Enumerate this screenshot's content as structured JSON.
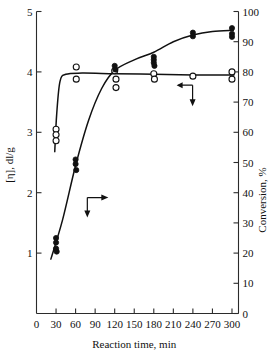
{
  "chart_data": {
    "type": "scatter",
    "title": "",
    "xlabel": "Reaction time, min",
    "ylabel": "[η], dl/g",
    "y2label": "Conversion, %",
    "xlim": [
      0,
      310
    ],
    "ylim": [
      0,
      5
    ],
    "y2lim": [
      0,
      100
    ],
    "xticks": [
      0,
      30,
      60,
      90,
      120,
      150,
      180,
      210,
      240,
      270,
      300
    ],
    "xticklabels": [
      "0",
      "30",
      "60",
      "90",
      "120",
      "150",
      "180",
      "210",
      "240",
      "270",
      "300"
    ],
    "yticks": [
      1,
      2,
      3,
      4,
      5
    ],
    "yticklabels": [
      "1",
      "2",
      "3",
      "4",
      "5"
    ],
    "y2ticks": [
      0,
      10,
      20,
      30,
      40,
      50,
      60,
      70,
      80,
      90,
      100
    ],
    "y2ticklabels": [
      "0",
      "10",
      "20",
      "30",
      "40",
      "50",
      "60",
      "70",
      "80",
      "90",
      "100"
    ],
    "grid": false,
    "legend": "none",
    "series": [
      {
        "name": "[η], dl/g",
        "marker": "open-circle",
        "axis": "left",
        "points": [
          {
            "x": 30,
            "y": 3.05
          },
          {
            "x": 30,
            "y": 2.96
          },
          {
            "x": 30,
            "y": 2.86
          },
          {
            "x": 61,
            "y": 4.08
          },
          {
            "x": 61,
            "y": 3.88
          },
          {
            "x": 120,
            "y": 4.02
          },
          {
            "x": 122,
            "y": 3.88
          },
          {
            "x": 122,
            "y": 3.74
          },
          {
            "x": 180,
            "y": 3.97
          },
          {
            "x": 181,
            "y": 3.88
          },
          {
            "x": 240,
            "y": 3.93
          },
          {
            "x": 300,
            "y": 4.0
          },
          {
            "x": 300,
            "y": 3.88
          }
        ],
        "curve": [
          {
            "x": 28,
            "y": 2.68
          },
          {
            "x": 31,
            "y": 3.3
          },
          {
            "x": 36,
            "y": 3.84
          },
          {
            "x": 45,
            "y": 3.96
          },
          {
            "x": 70,
            "y": 3.98
          },
          {
            "x": 120,
            "y": 3.97
          },
          {
            "x": 180,
            "y": 3.96
          },
          {
            "x": 240,
            "y": 3.95
          },
          {
            "x": 303,
            "y": 3.95
          }
        ]
      },
      {
        "name": "Conversion, %",
        "marker": "filled-circle",
        "axis": "right",
        "points": [
          {
            "x": 30,
            "y": 25.0
          },
          {
            "x": 30,
            "y": 23.5
          },
          {
            "x": 30,
            "y": 21.5
          },
          {
            "x": 31,
            "y": 20.5
          },
          {
            "x": 60,
            "y": 51.0
          },
          {
            "x": 60,
            "y": 49.5
          },
          {
            "x": 61,
            "y": 47.5
          },
          {
            "x": 120,
            "y": 82.0
          },
          {
            "x": 121,
            "y": 80.8
          },
          {
            "x": 180,
            "y": 85.0
          },
          {
            "x": 180,
            "y": 84.0
          },
          {
            "x": 180,
            "y": 83.0
          },
          {
            "x": 181,
            "y": 82.0
          },
          {
            "x": 240,
            "y": 93.0
          },
          {
            "x": 240,
            "y": 91.8
          },
          {
            "x": 300,
            "y": 94.5
          },
          {
            "x": 300,
            "y": 92.6
          },
          {
            "x": 300,
            "y": 91.6
          }
        ],
        "curve": [
          {
            "x": 22,
            "y": 18.0
          },
          {
            "x": 40,
            "y": 31.0
          },
          {
            "x": 60,
            "y": 49.0
          },
          {
            "x": 80,
            "y": 64.0
          },
          {
            "x": 100,
            "y": 74.5
          },
          {
            "x": 120,
            "y": 80.5
          },
          {
            "x": 150,
            "y": 84.0
          },
          {
            "x": 180,
            "y": 86.5
          },
          {
            "x": 210,
            "y": 90.0
          },
          {
            "x": 240,
            "y": 92.2
          },
          {
            "x": 270,
            "y": 93.4
          },
          {
            "x": 302,
            "y": 93.8
          }
        ]
      }
    ],
    "annotations": [
      {
        "name": "left-axis-arrow",
        "direction": "left-down",
        "x": 215,
        "y": 3.78,
        "refers_to": "[η], dl/g"
      },
      {
        "name": "right-axis-arrow",
        "direction": "right-down",
        "x": 78,
        "y": 1.92,
        "refers_to": "Conversion, %"
      }
    ]
  }
}
